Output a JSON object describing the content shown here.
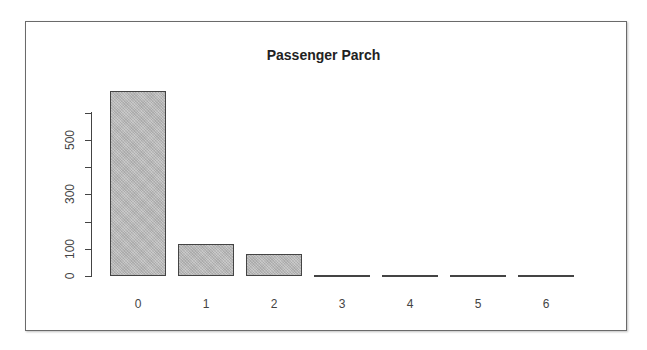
{
  "chart_data": {
    "type": "bar",
    "title": "Passenger Parch",
    "xlabel": "",
    "ylabel": "",
    "categories": [
      "0",
      "1",
      "2",
      "3",
      "4",
      "5",
      "6"
    ],
    "values": [
      678,
      118,
      80,
      5,
      4,
      5,
      1
    ],
    "ylim": [
      0,
      600
    ],
    "yticks": [
      0,
      100,
      200,
      300,
      400,
      500,
      600
    ],
    "ytick_labels": [
      "0",
      "100",
      "300",
      "500"
    ],
    "grid": false,
    "legend": null,
    "bar_color": "#bdbdbd",
    "border_color": "#444444"
  }
}
